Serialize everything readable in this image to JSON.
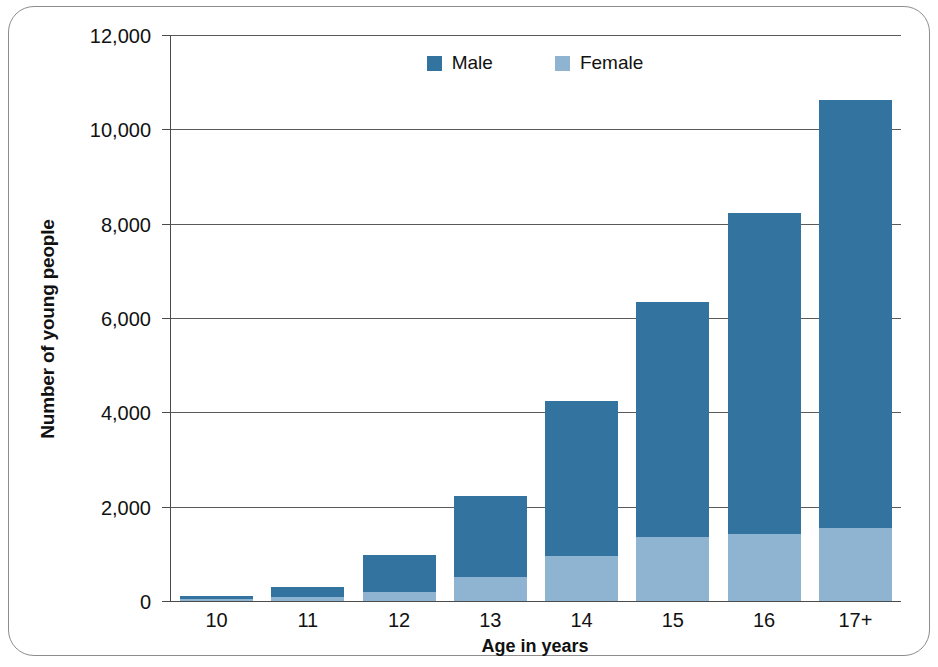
{
  "chart_data": {
    "type": "bar",
    "subtype": "stacked-vertical",
    "title": "",
    "xlabel": "Age in years",
    "ylabel": "Number of young people",
    "categories": [
      "10",
      "11",
      "12",
      "13",
      "14",
      "15",
      "16",
      "17+"
    ],
    "series": [
      {
        "name": "Female",
        "color": "#8eb4d2",
        "values": [
          40,
          90,
          200,
          510,
          950,
          1350,
          1420,
          1550
        ]
      },
      {
        "name": "Male",
        "color": "#33739f",
        "values": [
          60,
          210,
          780,
          1720,
          3300,
          5000,
          6800,
          9080
        ]
      }
    ],
    "totals": [
      100,
      300,
      980,
      2230,
      4250,
      6350,
      8220,
      10630
    ],
    "ylim": [
      0,
      12000
    ],
    "ytick_labels": [
      "12,000",
      "10,000",
      "8,000",
      "6,000",
      "4,000",
      "2,000",
      "0"
    ],
    "ytick_values": [
      12000,
      10000,
      8000,
      6000,
      4000,
      2000,
      0
    ],
    "grid": "horizontal",
    "legend_position": "top-center",
    "legend": [
      "Male",
      "Female"
    ]
  },
  "axes": {
    "y_title": "Number of young people",
    "x_title": "Age in years"
  },
  "legend": {
    "items": [
      {
        "label": "Male",
        "swatch": "legend-swatch-male"
      },
      {
        "label": "Female",
        "swatch": "legend-swatch-female"
      }
    ]
  },
  "colors": {
    "male": "#33739f",
    "female": "#8eb4d2",
    "axis": "#4a4a4a",
    "grid": "#5a5a5a",
    "frame": "#8d8d8d",
    "text": "#111111",
    "background": "#ffffff"
  }
}
